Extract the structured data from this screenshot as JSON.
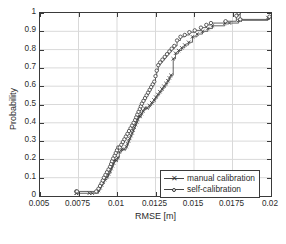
{
  "chart_data": {
    "type": "line",
    "title": "",
    "xlabel": "RMSE [m]",
    "ylabel": "Probability",
    "xlim": [
      0.005,
      0.02
    ],
    "ylim": [
      0,
      1
    ],
    "grid": true,
    "legend_position": "bottom-right",
    "xticks": [
      0.005,
      0.0075,
      0.01,
      0.0125,
      0.015,
      0.0175,
      0.02
    ],
    "xticklabels": [
      "0.005",
      "0.0075",
      "0.01",
      "0.0125",
      "0.015",
      "0.0175",
      "0.02"
    ],
    "yticks": [
      0,
      0.1,
      0.2,
      0.3,
      0.4,
      0.5,
      0.6,
      0.7,
      0.8,
      0.9,
      1
    ],
    "yticklabels": [
      "0",
      "0.1",
      "0.2",
      "0.3",
      "0.4",
      "0.5",
      "0.6",
      "0.7",
      "0.8",
      "0.9",
      "1"
    ],
    "series": [
      {
        "name": "manual calibration",
        "marker": "x",
        "color": "#3a3a3a",
        "x": [
          0.00735,
          0.00737,
          0.0082,
          0.0084,
          0.0088,
          0.0089,
          0.009,
          0.0091,
          0.0092,
          0.00935,
          0.00945,
          0.00955,
          0.00962,
          0.0097,
          0.00978,
          0.00985,
          0.00995,
          0.01005,
          0.01015,
          0.0103,
          0.01045,
          0.0106,
          0.01068,
          0.01075,
          0.01082,
          0.0109,
          0.01098,
          0.01105,
          0.01112,
          0.0112,
          0.01128,
          0.01135,
          0.01142,
          0.0115,
          0.01158,
          0.01168,
          0.0118,
          0.01195,
          0.0121,
          0.01225,
          0.0124,
          0.01252,
          0.01265,
          0.01278,
          0.01292,
          0.01305,
          0.01318,
          0.0133,
          0.0134,
          0.0135,
          0.01365,
          0.0138,
          0.014,
          0.0142,
          0.0144,
          0.01465,
          0.0149,
          0.0152,
          0.01555,
          0.0159,
          0.0162,
          0.017,
          0.0173,
          0.0179,
          0.018,
          0.0198,
          0.01995
        ],
        "y": [
          0.015,
          0.015,
          0.015,
          0.015,
          0.03,
          0.045,
          0.06,
          0.075,
          0.09,
          0.105,
          0.12,
          0.135,
          0.15,
          0.165,
          0.18,
          0.195,
          0.195,
          0.21,
          0.24,
          0.255,
          0.255,
          0.27,
          0.285,
          0.3,
          0.315,
          0.33,
          0.345,
          0.36,
          0.375,
          0.39,
          0.405,
          0.42,
          0.435,
          0.435,
          0.45,
          0.465,
          0.48,
          0.48,
          0.495,
          0.51,
          0.525,
          0.54,
          0.555,
          0.57,
          0.585,
          0.6,
          0.615,
          0.63,
          0.645,
          0.66,
          0.75,
          0.78,
          0.795,
          0.81,
          0.825,
          0.84,
          0.87,
          0.885,
          0.9,
          0.915,
          0.93,
          0.945,
          0.945,
          0.96,
          0.96,
          0.975,
          0.975
        ]
      },
      {
        "name": "self-calibration",
        "marker": "o",
        "color": "#3a3a3a",
        "x": [
          0.00735,
          0.0074,
          0.00865,
          0.0088,
          0.0089,
          0.009,
          0.00908,
          0.00915,
          0.00925,
          0.00935,
          0.00945,
          0.00955,
          0.00962,
          0.00968,
          0.00975,
          0.00985,
          0.00992,
          0.01,
          0.01008,
          0.01018,
          0.01028,
          0.01038,
          0.01048,
          0.01058,
          0.01068,
          0.01078,
          0.01088,
          0.01098,
          0.01108,
          0.01118,
          0.01125,
          0.01132,
          0.0114,
          0.01148,
          0.01155,
          0.01162,
          0.01172,
          0.01182,
          0.01192,
          0.01202,
          0.01212,
          0.01222,
          0.01232,
          0.01242,
          0.0125,
          0.01258,
          0.01268,
          0.0128,
          0.01295,
          0.0131,
          0.01325,
          0.0134,
          0.01355,
          0.01372,
          0.0139,
          0.01412,
          0.0144,
          0.0147,
          0.01505,
          0.01545,
          0.0158,
          0.0161,
          0.01705,
          0.01775,
          0.0179,
          0.018,
          0.0199
        ],
        "y": [
          0.025,
          0.025,
          0.025,
          0.04,
          0.055,
          0.07,
          0.085,
          0.1,
          0.115,
          0.13,
          0.145,
          0.16,
          0.175,
          0.19,
          0.205,
          0.22,
          0.235,
          0.25,
          0.265,
          0.265,
          0.28,
          0.295,
          0.31,
          0.325,
          0.34,
          0.355,
          0.37,
          0.385,
          0.4,
          0.415,
          0.43,
          0.445,
          0.46,
          0.475,
          0.49,
          0.505,
          0.52,
          0.535,
          0.55,
          0.565,
          0.58,
          0.595,
          0.61,
          0.625,
          0.655,
          0.685,
          0.715,
          0.73,
          0.745,
          0.76,
          0.775,
          0.79,
          0.805,
          0.82,
          0.85,
          0.87,
          0.88,
          0.895,
          0.905,
          0.92,
          0.935,
          0.945,
          0.955,
          0.985,
          1.0,
          0.965,
          0.98
        ]
      }
    ]
  },
  "legend": {
    "items": [
      {
        "label": "manual calibration",
        "marker": "x"
      },
      {
        "label": "self-calibration",
        "marker": "o"
      }
    ]
  },
  "caption": ""
}
